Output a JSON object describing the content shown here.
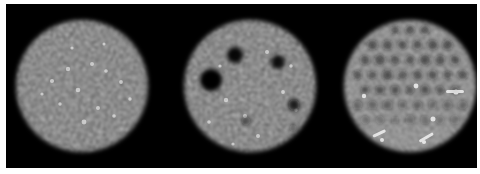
{
  "figure": {
    "title": "Reconstructed phantom images",
    "background_color": "#ffffff",
    "panel_background_color": "#000000",
    "width": 480,
    "height": 174,
    "strip": {
      "x": 6,
      "y": 4,
      "width": 471,
      "height": 164
    }
  },
  "panels": [
    {
      "id": "panel-uniform",
      "label": "uniform noise disk",
      "index": 1,
      "center_x": 82,
      "center_y": 86,
      "radius": 67,
      "mean_level": 0.52,
      "noise_contrast": 0.46,
      "noise_scale": 0.42,
      "blur": 1.5,
      "brightness": 1.0,
      "features": []
    },
    {
      "id": "panel-cold-lesions",
      "label": "disk with cold lesions",
      "index": 2,
      "center_x": 244,
      "center_y": 86,
      "radius": 67,
      "mean_level": 0.52,
      "noise_contrast": 0.46,
      "noise_scale": 0.42,
      "blur": 1.5,
      "brightness": 1.0,
      "features": [
        {
          "name": "lesion-large-left",
          "cx": 205,
          "cy": 80,
          "r": 11,
          "depth": 1.0
        },
        {
          "name": "lesion-medium-top",
          "cx": 229,
          "cy": 55,
          "r": 8,
          "depth": 0.95
        },
        {
          "name": "lesion-medium-right",
          "cx": 272,
          "cy": 62,
          "r": 7,
          "depth": 0.9
        },
        {
          "name": "lesion-small-lowerright",
          "cx": 288,
          "cy": 105,
          "r": 6,
          "depth": 0.88
        },
        {
          "name": "lesion-tiny-center",
          "cx": 240,
          "cy": 121,
          "r": 4,
          "depth": 0.6
        },
        {
          "name": "lesion-tiny-right",
          "cx": 287,
          "cy": 128,
          "r": 3,
          "depth": 0.5
        }
      ]
    },
    {
      "id": "panel-rod-pattern",
      "label": "disk with rod resolution pattern",
      "index": 3,
      "center_x": 404,
      "center_y": 86,
      "radius": 67,
      "mean_level": 0.7,
      "noise_contrast": 0.4,
      "noise_scale": 0.5,
      "blur": 1.4,
      "brightness": 1.28,
      "rod_spacing_x": 15,
      "rod_spacing_y": 15,
      "rod_radius": 4.4,
      "rod_depth": 0.62,
      "rod_rows": 6,
      "features": []
    }
  ],
  "colormap": {
    "name": "grayscale",
    "low": "#000000",
    "high": "#ffffff"
  }
}
